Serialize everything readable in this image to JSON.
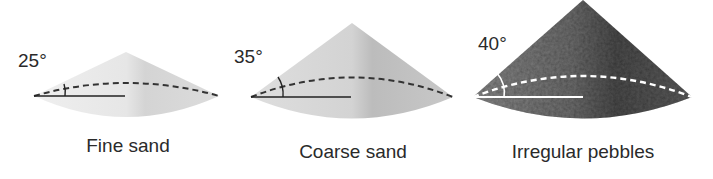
{
  "figure": {
    "cones": [
      {
        "angle_label": "25°",
        "caption": "Fine sand",
        "angle_deg": 25,
        "fill": "#e4e4e4",
        "shade": "#cfcfcf",
        "line_color": "#333333"
      },
      {
        "angle_label": "35°",
        "caption": "Coarse sand",
        "angle_deg": 35,
        "fill": "#d2d2d2",
        "shade": "#b8b8b8",
        "line_color": "#333333"
      },
      {
        "angle_label": "40°",
        "caption": "Irregular pebbles",
        "angle_deg": 40,
        "fill": "#6f6f6f",
        "shade": "#4a4a4a",
        "line_color": "#ffffff"
      }
    ]
  }
}
